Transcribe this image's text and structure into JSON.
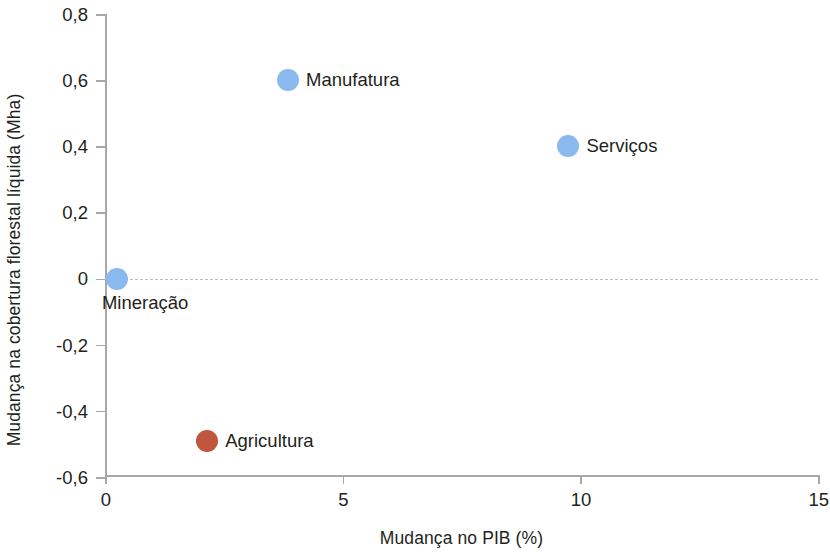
{
  "chart_data": {
    "type": "scatter",
    "title": "",
    "xlabel": "Mudança no PIB (%)",
    "ylabel": "Mudança na cobertura florestal líquida (Mha)",
    "xlim": [
      0,
      15
    ],
    "ylim": [
      -0.6,
      0.8
    ],
    "xticks": [
      "0",
      "5",
      "10",
      "15"
    ],
    "xtick_values": [
      0,
      5,
      10,
      15
    ],
    "yticks": [
      "0,8",
      "0,6",
      "0,4",
      "0,2",
      "0",
      "-0,2",
      "-0,4",
      "-0,6"
    ],
    "ytick_values": [
      0.8,
      0.6,
      0.4,
      0.2,
      0,
      -0.2,
      -0.4,
      -0.6
    ],
    "grid": false,
    "legend": "none",
    "zero_reference_line": {
      "value": 0,
      "style": "dashed",
      "color": "#bdbdbd"
    },
    "decimal_separator": ",",
    "points": [
      {
        "label": "Mineração",
        "x": 0.25,
        "y": 0.0,
        "color": "#8ab9ef",
        "label_position": "below"
      },
      {
        "label": "Manufatura",
        "x": 3.85,
        "y": 0.6,
        "color": "#8ab9ef",
        "label_position": "right"
      },
      {
        "label": "Serviços",
        "x": 9.75,
        "y": 0.4,
        "color": "#8ab9ef",
        "label_position": "right"
      },
      {
        "label": "Agricultura",
        "x": 2.15,
        "y": -0.49,
        "color": "#bf563d",
        "label_position": "right"
      }
    ]
  },
  "colors": {
    "series_blue": "#8ab9ef",
    "series_red": "#bf563d",
    "axis": "#a8a8a8",
    "text": "#231f20",
    "zero_line": "#bdbdbd",
    "background": "#ffffff"
  }
}
